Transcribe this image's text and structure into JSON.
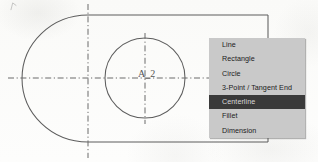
{
  "app": {
    "type": "cad-sketch-canvas",
    "background_color": "#fdfdfc",
    "line_color": "#5d5d5d"
  },
  "drawing": {
    "label": "A_2",
    "outline_name": "slot-profile-outline",
    "circle_name": "bore-circle",
    "centerline_style": "dash-dot",
    "geometry": {
      "top_edge_y": 15,
      "bottom_edge_y": 142,
      "arc_left_x": 22,
      "arc_center_x": 88,
      "right_edge_x": 268,
      "horizontal_centerline_y": 78,
      "vertical_centerline_x": 88,
      "circle_center_x": 145,
      "circle_center_y": 78,
      "circle_radius": 40
    }
  },
  "context_menu": {
    "name": "sketch-entity-menu",
    "background_color": "#c9c9c9",
    "highlight_color": "#3a3a3a",
    "highlight_text_color": "#d8d8d8",
    "selected_index": 4,
    "items": [
      {
        "label": "Line"
      },
      {
        "label": "Rectangle"
      },
      {
        "label": "Circle"
      },
      {
        "label": "3-Point / Tangent End"
      },
      {
        "label": "Centerline"
      },
      {
        "label": "Fillet"
      },
      {
        "label": "Dimension"
      }
    ]
  }
}
